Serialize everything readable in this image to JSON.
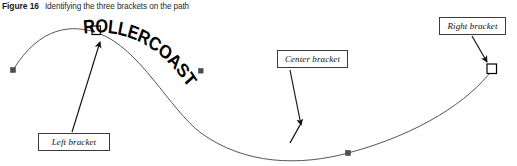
{
  "caption": {
    "label": "Figure 16",
    "text": "Identifying the three brackets on the path"
  },
  "artwork": {
    "path_text": "ROLLERCOASTER",
    "path_text_color": "#000000",
    "curve_color": "#555555",
    "anchor_fill_color": "#4d4d4d",
    "bracket_stroke_color": "#000000",
    "bracket_fill_color": "#ffffff",
    "arrow_color": "#111111"
  },
  "callouts": [
    {
      "id": "left",
      "label": "Left bracket"
    },
    {
      "id": "center",
      "label": "Center bracket"
    },
    {
      "id": "right",
      "label": "Right bracket"
    }
  ]
}
